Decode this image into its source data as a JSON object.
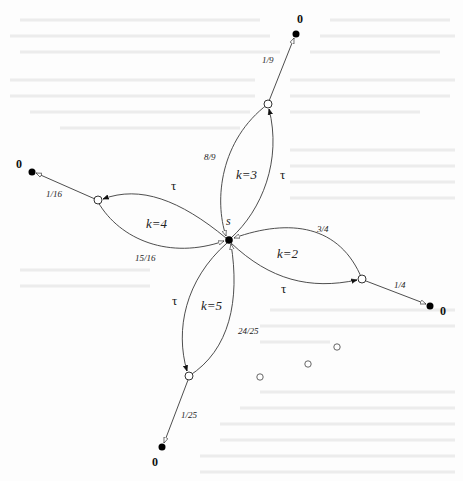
{
  "diagram": {
    "type": "state-transition-graph",
    "center": {
      "label": "s"
    },
    "branches": [
      {
        "k_label": "k=3",
        "tau_label": "τ",
        "return_prob": "8/9",
        "exit_prob": "1/9",
        "terminal_label": "0"
      },
      {
        "k_label": "k=4",
        "tau_label": "τ",
        "return_prob": "15/16",
        "exit_prob": "1/16",
        "terminal_label": "0"
      },
      {
        "k_label": "k=2",
        "tau_label": "τ",
        "return_prob": "3/4",
        "exit_prob": "1/4",
        "terminal_label": "0"
      },
      {
        "k_label": "k=5",
        "tau_label": "τ",
        "return_prob": "24/25",
        "exit_prob": "1/25",
        "terminal_label": "0"
      }
    ],
    "ellipsis": [
      "○",
      "○",
      "○"
    ],
    "colors": {
      "line": "#3a3a3a",
      "filled_node": "#000000",
      "open_node": "#ffffff"
    }
  }
}
